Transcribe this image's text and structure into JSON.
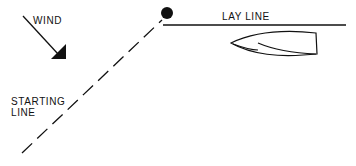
{
  "diagram": {
    "labels": {
      "wind": "WIND",
      "lay_line": "LAY LINE",
      "starting_line_1": "STARTING",
      "starting_line_2": "LINE"
    },
    "elements": [
      {
        "id": "wind-arrow",
        "kind": "arrow",
        "meaning": "wind direction"
      },
      {
        "id": "committee-mark",
        "kind": "filled-circle",
        "meaning": "starting mark"
      },
      {
        "id": "starting-line",
        "kind": "dashed-line"
      },
      {
        "id": "lay-line",
        "kind": "solid-line"
      },
      {
        "id": "boat",
        "kind": "hull-outline"
      }
    ],
    "colors": {
      "ink": "#111111",
      "background": "#ffffff"
    }
  }
}
